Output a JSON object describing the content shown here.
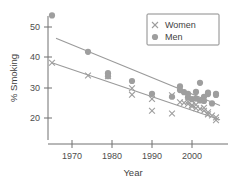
{
  "chart_data": {
    "type": "scatter",
    "title": "",
    "xlabel": "Year",
    "ylabel": "% Smoking",
    "xlim": [
      1963,
      2008
    ],
    "ylim": [
      17,
      56
    ],
    "grid": false,
    "legend_position": "top-right",
    "xticks": [
      1970,
      1980,
      1990,
      2000
    ],
    "yticks": [
      20,
      30,
      40,
      50
    ],
    "xtick_labels": [
      "1970",
      "1980",
      "1990",
      "2000"
    ],
    "ytick_labels": [
      "20",
      "30",
      "40",
      "50"
    ],
    "series": [
      {
        "name": "Women",
        "marker": "x",
        "color": "#9e9e9e",
        "points": [
          [
            1965,
            38.2
          ],
          [
            1974,
            34.0
          ],
          [
            1979,
            33.8
          ],
          [
            1985,
            29.8
          ],
          [
            1985,
            27.7
          ],
          [
            1990,
            26.3
          ],
          [
            1990,
            22.4
          ],
          [
            1995,
            27.5
          ],
          [
            1995,
            21.5
          ],
          [
            1997,
            25.2
          ],
          [
            1998,
            25.0
          ],
          [
            1999,
            24.6
          ],
          [
            1999,
            25.4
          ],
          [
            2000,
            24.3
          ],
          [
            2000,
            23.8
          ],
          [
            2001,
            24.4
          ],
          [
            2001,
            23.2
          ],
          [
            2002,
            23.0
          ],
          [
            2003,
            22.4
          ],
          [
            2003,
            23.4
          ],
          [
            2004,
            21.9
          ],
          [
            2004,
            21.2
          ],
          [
            2005,
            20.8
          ],
          [
            2006,
            20.2
          ],
          [
            2006,
            19.3
          ]
        ]
      },
      {
        "name": "Men",
        "marker": "o",
        "color": "#9e9e9e",
        "points": [
          [
            1965,
            53.8
          ],
          [
            1974,
            41.8
          ],
          [
            1979,
            34.8
          ],
          [
            1979,
            33.8
          ],
          [
            1985,
            32.2
          ],
          [
            1990,
            28.0
          ],
          [
            1995,
            27.0
          ],
          [
            1997,
            30.4
          ],
          [
            1997,
            29.2
          ],
          [
            1998,
            28.5
          ],
          [
            1999,
            26.8
          ],
          [
            1999,
            28.0
          ],
          [
            2000,
            26.2
          ],
          [
            2001,
            28.6
          ],
          [
            2001,
            26.4
          ],
          [
            2002,
            31.6
          ],
          [
            2002,
            25.8
          ],
          [
            2003,
            27.0
          ],
          [
            2003,
            25.6
          ],
          [
            2004,
            28.4
          ],
          [
            2004,
            27.9
          ],
          [
            2005,
            24.8
          ],
          [
            2006,
            28.0
          ],
          [
            2006,
            27.6
          ]
        ]
      }
    ],
    "trend_lines": [
      {
        "name": "Men trend",
        "x": [
          1966,
          2007
        ],
        "y": [
          46.3,
          24.1
        ],
        "color": "#9a9a9a"
      },
      {
        "name": "Women trend",
        "x": [
          1965,
          2007
        ],
        "y": [
          38.2,
          19.4
        ],
        "color": "#9a9a9a"
      }
    ]
  },
  "legend": {
    "entries": [
      {
        "label": "Women",
        "marker": "x"
      },
      {
        "label": "Men",
        "marker": "o"
      }
    ]
  },
  "axes": {
    "x_title": "Year",
    "y_title": "% Smoking"
  }
}
